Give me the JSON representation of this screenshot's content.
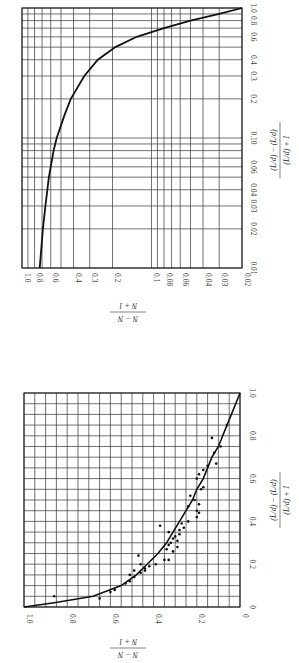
{
  "chart_data": [
    {
      "id": "top-plot",
      "type": "line",
      "orientation_note": "figure rotated 90deg clockwise in the image",
      "scale": "log-log",
      "xlabel": "(L/d) − (L/d)min / (L/d) + 1",
      "ylabel": "N − Nmin / N + 1",
      "x_ticks": [
        "0.01",
        "0.02",
        "0.03",
        "0.04",
        "0.06",
        "0.10",
        "0.2",
        "0.3",
        "0.4",
        "0.6",
        "0.8",
        "1.0"
      ],
      "y_ticks": [
        "1.0",
        "0.8",
        "0.6",
        "0.4",
        "0.3",
        "0.2",
        "0.1",
        "0.08",
        "0.06",
        "0.04",
        "0.03",
        "0.02"
      ],
      "xlim": [
        0.01,
        1.0
      ],
      "ylim": [
        0.02,
        1.0
      ],
      "grid": true,
      "series": [
        {
          "name": "fit curve",
          "x": [
            0.01,
            0.02,
            0.03,
            0.05,
            0.08,
            0.1,
            0.15,
            0.2,
            0.3,
            0.4,
            0.5,
            0.6,
            0.7,
            0.8,
            0.9,
            1.0
          ],
          "y": [
            0.73,
            0.69,
            0.66,
            0.62,
            0.57,
            0.54,
            0.47,
            0.42,
            0.33,
            0.26,
            0.19,
            0.13,
            0.08,
            0.05,
            0.03,
            0.02
          ]
        }
      ]
    },
    {
      "id": "bottom-plot",
      "type": "scatter",
      "orientation_note": "figure rotated 90deg clockwise in the image",
      "scale": "linear",
      "xlabel": "(L/d) − (L/d)min / (L/d) + 1",
      "ylabel": "N − Nmin / N + 1",
      "x_ticks": [
        "0",
        "0.2",
        "0.4",
        "0.6",
        "0.8",
        "1.0"
      ],
      "y_ticks": [
        "1.0",
        "0.8",
        "0.6",
        "0.4",
        "0.2",
        "0"
      ],
      "xlim": [
        0,
        1.0
      ],
      "ylim": [
        0,
        1.0
      ],
      "grid": true,
      "series": [
        {
          "name": "fit curve",
          "x": [
            0.0,
            0.02,
            0.05,
            0.1,
            0.15,
            0.2,
            0.25,
            0.3,
            0.35,
            0.4,
            0.45,
            0.5,
            0.55,
            0.6,
            0.65,
            0.7,
            0.75,
            0.8,
            0.85,
            0.9,
            0.95,
            1.0
          ],
          "y": [
            1.0,
            0.86,
            0.68,
            0.55,
            0.48,
            0.43,
            0.38,
            0.34,
            0.31,
            0.28,
            0.25,
            0.22,
            0.2,
            0.17,
            0.15,
            0.13,
            0.1,
            0.08,
            0.06,
            0.04,
            0.02,
            0.0
          ]
        },
        {
          "name": "data points",
          "x": [
            0.05,
            0.04,
            0.07,
            0.08,
            0.11,
            0.12,
            0.14,
            0.15,
            0.16,
            0.17,
            0.17,
            0.18,
            0.19,
            0.2,
            0.2,
            0.22,
            0.22,
            0.24,
            0.26,
            0.27,
            0.28,
            0.29,
            0.3,
            0.31,
            0.32,
            0.33,
            0.34,
            0.35,
            0.36,
            0.37,
            0.38,
            0.39,
            0.4,
            0.42,
            0.44,
            0.45,
            0.47,
            0.48,
            0.5,
            0.52,
            0.55,
            0.56,
            0.6,
            0.62,
            0.64,
            0.66,
            0.67,
            0.72,
            0.75,
            0.79,
            0.85
          ],
          "y": [
            0.86,
            0.65,
            0.6,
            0.58,
            0.53,
            0.51,
            0.49,
            0.51,
            0.46,
            0.44,
            0.49,
            0.44,
            0.42,
            0.46,
            0.39,
            0.35,
            0.33,
            0.47,
            0.31,
            0.34,
            0.29,
            0.33,
            0.32,
            0.29,
            0.31,
            0.3,
            0.28,
            0.33,
            0.28,
            0.26,
            0.37,
            0.27,
            0.24,
            0.2,
            0.19,
            0.2,
            0.24,
            0.19,
            0.21,
            0.23,
            0.18,
            0.17,
            0.2,
            0.19,
            0.17,
            0.15,
            0.11,
            0.12,
            0.09,
            0.13,
            0.06
          ]
        }
      ]
    }
  ],
  "figure": {
    "top": {
      "axis_h_label_num": "N − N",
      "axis_h_label_sub": "min",
      "axis_h_label_den": "N + 1",
      "axis_v_label_num": "(L/d) − (L/d)",
      "axis_v_label_sub": "min",
      "axis_v_label_den": "(L/d) + 1"
    },
    "bottom": {
      "axis_h_label_num": "N − N",
      "axis_h_label_sub": "min",
      "axis_h_label_den": "N + 1",
      "axis_v_label_num": "(L/d) − (L/d)",
      "axis_v_label_sub": "min",
      "axis_v_label_den": "(L/d) + 1"
    }
  }
}
